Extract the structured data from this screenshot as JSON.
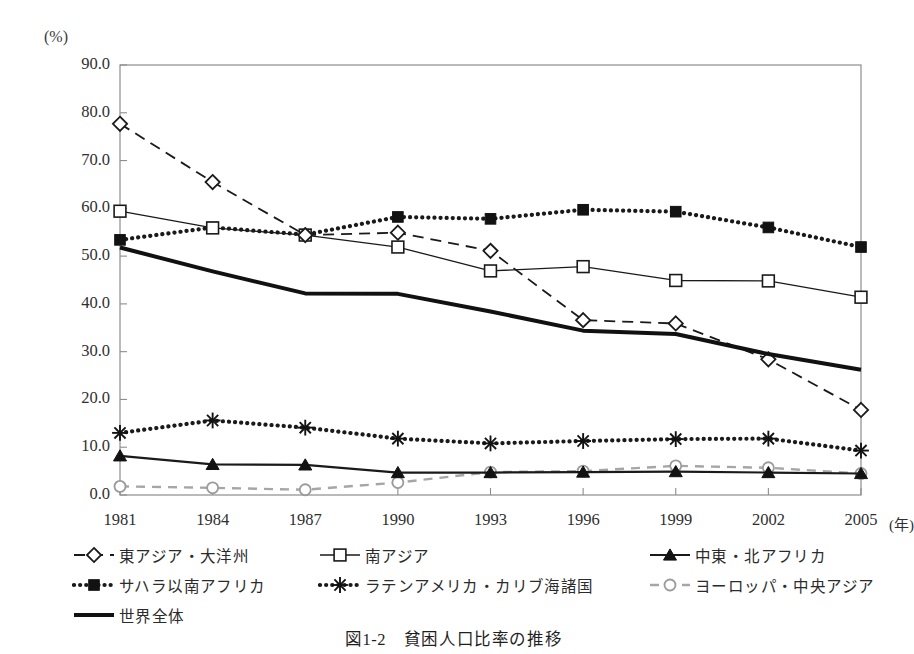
{
  "figure": {
    "caption": "図1-2　貧困人口比率の推移",
    "y_unit_label": "(%)",
    "x_unit_label": "(年)"
  },
  "chart_data": {
    "type": "line",
    "title": "図1-2　貧困人口比率の推移",
    "xlabel": "(年)",
    "ylabel": "(%)",
    "x": [
      1981,
      1984,
      1987,
      1990,
      1993,
      1996,
      1999,
      2002,
      2005
    ],
    "xtick_labels": [
      "1981",
      "1984",
      "1987",
      "1990",
      "1993",
      "1996",
      "1999",
      "2002",
      "2005"
    ],
    "ytick_labels": [
      "90.0",
      "80.0",
      "70.0",
      "60.0",
      "50.0",
      "40.0",
      "30.0",
      "20.0",
      "10.0",
      "0.0"
    ],
    "ylim": [
      0.0,
      90.0
    ],
    "ytick_step": 10.0,
    "grid": false,
    "legend_position": "below-axes",
    "series": [
      {
        "name": "東アジア・大洋州",
        "marker": "open-diamond",
        "line_style": "dashed",
        "color": "#1a1a1a",
        "values": [
          77.7,
          65.5,
          54.4,
          54.9,
          51.1,
          36.6,
          35.9,
          28.4,
          17.8
        ]
      },
      {
        "name": "南アジア",
        "marker": "open-square",
        "line_style": "solid-thin",
        "color": "#1a1a1a",
        "values": [
          59.4,
          55.9,
          54.4,
          51.9,
          46.9,
          47.8,
          44.9,
          44.8,
          41.4
        ]
      },
      {
        "name": "中東・北アフリカ",
        "marker": "filled-triangle",
        "line_style": "solid",
        "color": "#1a1a1a",
        "values": [
          8.2,
          6.4,
          6.3,
          4.7,
          4.7,
          4.8,
          4.9,
          4.7,
          4.5
        ]
      },
      {
        "name": "サハラ以南アフリカ",
        "marker": "filled-square",
        "line_style": "dotted",
        "color": "#1a1a1a",
        "values": [
          53.4,
          56.0,
          54.5,
          58.2,
          57.8,
          59.7,
          59.3,
          56.0,
          51.9
        ]
      },
      {
        "name": "ラテンアメリカ・カリブ海諸国",
        "marker": "asterisk",
        "line_style": "dotted",
        "color": "#1a1a1a",
        "values": [
          13.0,
          15.6,
          14.1,
          11.8,
          10.8,
          11.3,
          11.7,
          11.8,
          9.3
        ]
      },
      {
        "name": "ヨーロッパ・中央アジア",
        "marker": "open-circle",
        "line_style": "dashed-gray",
        "color": "#9a9a9a",
        "values": [
          1.8,
          1.5,
          1.1,
          2.6,
          4.8,
          5.0,
          6.1,
          5.7,
          4.5
        ]
      },
      {
        "name": "世界全体",
        "marker": "none",
        "line_style": "thick-solid",
        "color": "#111111",
        "values": [
          51.8,
          46.8,
          42.2,
          42.1,
          38.4,
          34.4,
          33.7,
          29.5,
          26.2
        ]
      }
    ]
  },
  "legend": {
    "rows": [
      [
        {
          "label": "東アジア・大洋州",
          "symbol": "open-diamond-dashed"
        },
        {
          "label": "南アジア",
          "symbol": "open-square-solid"
        },
        {
          "label": "中東・北アフリカ",
          "symbol": "filled-triangle-solid"
        }
      ],
      [
        {
          "label": "サハラ以南アフリカ",
          "symbol": "filled-square-dotted"
        },
        {
          "label": "ラテンアメリカ・カリブ海諸国",
          "symbol": "asterisk-dotted"
        },
        {
          "label": "ヨーロッパ・中央アジア",
          "symbol": "open-circle-dashed-gray"
        }
      ],
      [
        {
          "label": "世界全体",
          "symbol": "thick-solid"
        }
      ]
    ]
  }
}
